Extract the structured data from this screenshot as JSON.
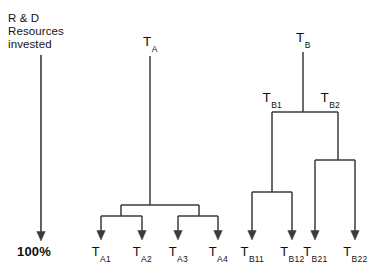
{
  "figure": {
    "axis": {
      "caption": "R & D\nResources\ninvested",
      "bottom_label": "100%",
      "arrow_direction": "down",
      "x": 41,
      "y_top": 55,
      "y_bottom": 241
    },
    "stroke_color": "#3a3a3a",
    "background": "#ffffff",
    "trees": [
      {
        "name": "tree-a",
        "root": {
          "label": "T",
          "sub": "A",
          "x": 150,
          "y_label": 44,
          "y_stem_top": 56,
          "y_stem_bottom": 205
        },
        "splits": [
          {
            "name": "split-a-root",
            "y": 205,
            "x_left": 121,
            "x_right": 199
          },
          {
            "name": "split-a-left",
            "y": 216,
            "x_left": 101,
            "x_right": 142
          },
          {
            "name": "split-a-right",
            "y": 216,
            "x_left": 178,
            "x_right": 218
          }
        ],
        "connectors": [
          {
            "x": 121,
            "y_top": 205,
            "y_bottom": 216
          },
          {
            "x": 199,
            "y_top": 205,
            "y_bottom": 216
          }
        ],
        "leaves": [
          {
            "label": "T",
            "sub": "A1",
            "x": 101,
            "y_arrow_top": 216,
            "y_arrow_tip": 240,
            "y_label": 244
          },
          {
            "label": "T",
            "sub": "A2",
            "x": 142,
            "y_arrow_top": 216,
            "y_arrow_tip": 240,
            "y_label": 244
          },
          {
            "label": "T",
            "sub": "A3",
            "x": 178,
            "y_arrow_top": 216,
            "y_arrow_tip": 240,
            "y_label": 244
          },
          {
            "label": "T",
            "sub": "A4",
            "x": 218,
            "y_arrow_top": 216,
            "y_arrow_tip": 240,
            "y_label": 244
          }
        ]
      },
      {
        "name": "tree-b",
        "root": {
          "label": "T",
          "sub": "B",
          "x": 303,
          "y_label": 40,
          "y_stem_top": 52,
          "y_stem_bottom": 112
        },
        "internal_nodes": [
          {
            "label": "T",
            "sub": "B1",
            "x": 272,
            "y_label": 100
          },
          {
            "label": "T",
            "sub": "B2",
            "x": 330,
            "y_label": 100
          }
        ],
        "splits": [
          {
            "name": "split-b-root",
            "y": 112,
            "x_left": 272,
            "x_right": 338
          },
          {
            "name": "split-b1",
            "y": 192,
            "x_left": 252,
            "x_right": 292
          },
          {
            "name": "split-b2",
            "y": 160,
            "x_left": 315,
            "x_right": 355
          }
        ],
        "connectors": [
          {
            "x": 272,
            "y_top": 112,
            "y_bottom": 192
          },
          {
            "x": 338,
            "y_top": 112,
            "y_bottom": 160
          }
        ],
        "leaves": [
          {
            "label": "T",
            "sub": "B11",
            "x": 252,
            "y_arrow_top": 192,
            "y_arrow_tip": 240,
            "y_label": 244
          },
          {
            "label": "T",
            "sub": "B12",
            "x": 292,
            "y_arrow_top": 192,
            "y_arrow_tip": 240,
            "y_label": 244
          },
          {
            "label": "T",
            "sub": "B21",
            "x": 315,
            "y_arrow_top": 160,
            "y_arrow_tip": 240,
            "y_label": 244
          },
          {
            "label": "T",
            "sub": "B22",
            "x": 355,
            "y_arrow_top": 160,
            "y_arrow_tip": 240,
            "y_label": 244
          }
        ]
      }
    ]
  }
}
